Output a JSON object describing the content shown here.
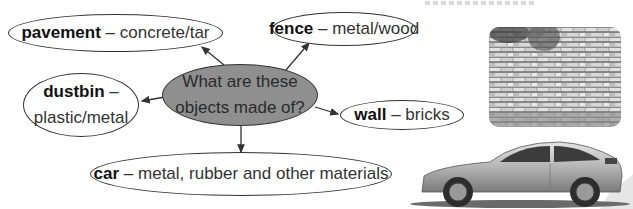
{
  "diagram": {
    "type": "mind-map",
    "center": {
      "line1": "What are these",
      "line2": "objects made of?"
    },
    "nodes": [
      {
        "id": "pavement",
        "term": "pavement",
        "separator": " – ",
        "material": "concrete/tar"
      },
      {
        "id": "fence",
        "term": "fence",
        "separator": " – ",
        "material": "metal/wood"
      },
      {
        "id": "dustbin",
        "term": "dustbin",
        "separator": " –",
        "material": "plastic/metal"
      },
      {
        "id": "wall",
        "term": "wall",
        "separator": " – ",
        "material": "bricks"
      },
      {
        "id": "car",
        "term": "car",
        "separator": " – ",
        "material": "metal, rubber and other materials"
      }
    ],
    "images": [
      {
        "id": "stone-wall-photo",
        "depicts": "stone wall"
      },
      {
        "id": "car-photo",
        "depicts": "silver sedan car"
      }
    ],
    "colors": {
      "center_fill": "#8f8f8f",
      "outline": "#333333",
      "background": "#ffffff"
    }
  }
}
